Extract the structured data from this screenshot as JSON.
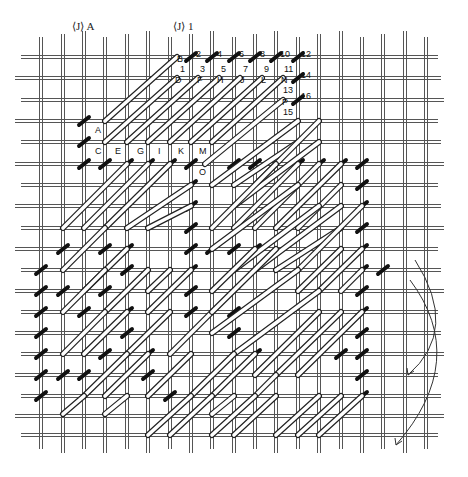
{
  "diagram": {
    "headers": [
      {
        "text": "⟨J⟩",
        "suffix": "A",
        "x": 72,
        "y": 30
      },
      {
        "text": "⟨J⟩",
        "suffix": "1",
        "x": 173,
        "y": 30
      }
    ],
    "grid": {
      "columns_x": [
        41,
        63,
        84,
        105,
        127,
        148,
        170,
        191,
        212,
        234,
        255,
        276,
        298,
        319,
        341,
        362,
        383,
        405,
        426
      ],
      "rows_y": [
        57,
        78,
        100,
        121,
        142,
        164,
        185,
        206,
        228,
        249,
        270,
        291,
        312,
        333,
        354,
        375,
        396,
        416,
        435
      ],
      "thread_color": "#555555",
      "style": "double-thread (Penelope) canvas"
    },
    "letter_labels": [
      {
        "text": "B",
        "x": 177,
        "y": 59
      },
      {
        "text": "D",
        "x": 175,
        "y": 80
      },
      {
        "text": "F",
        "x": 197,
        "y": 80
      },
      {
        "text": "H",
        "x": 217,
        "y": 80
      },
      {
        "text": "J",
        "x": 240,
        "y": 80
      },
      {
        "text": "L",
        "x": 261,
        "y": 80
      },
      {
        "text": "N",
        "x": 281,
        "y": 80
      },
      {
        "text": "P",
        "x": 282,
        "y": 102
      },
      {
        "text": "A",
        "x": 95,
        "y": 130
      },
      {
        "text": "C",
        "x": 95,
        "y": 151
      },
      {
        "text": "E",
        "x": 115,
        "y": 151
      },
      {
        "text": "G",
        "x": 137,
        "y": 151
      },
      {
        "text": "I",
        "x": 158,
        "y": 151
      },
      {
        "text": "K",
        "x": 178,
        "y": 151
      },
      {
        "text": "M",
        "x": 199,
        "y": 151
      },
      {
        "text": "O",
        "x": 199,
        "y": 172
      }
    ],
    "number_labels": [
      {
        "text": "1",
        "x": 180,
        "y": 69
      },
      {
        "text": "2",
        "x": 196,
        "y": 54
      },
      {
        "text": "3",
        "x": 200,
        "y": 69
      },
      {
        "text": "4",
        "x": 217,
        "y": 54
      },
      {
        "text": "5",
        "x": 221,
        "y": 69
      },
      {
        "text": "6",
        "x": 239,
        "y": 54
      },
      {
        "text": "7",
        "x": 243,
        "y": 69
      },
      {
        "text": "8",
        "x": 260,
        "y": 54
      },
      {
        "text": "9",
        "x": 264,
        "y": 69
      },
      {
        "text": "10",
        "x": 280,
        "y": 54
      },
      {
        "text": "11",
        "x": 284,
        "y": 69
      },
      {
        "text": "12",
        "x": 301,
        "y": 54
      },
      {
        "text": "13",
        "x": 283,
        "y": 90
      },
      {
        "text": "14",
        "x": 301,
        "y": 75
      },
      {
        "text": "15",
        "x": 283,
        "y": 112
      },
      {
        "text": "16",
        "x": 301,
        "y": 96
      }
    ],
    "tent_stitches": [
      [
        191,
        57
      ],
      [
        212,
        57
      ],
      [
        234,
        57
      ],
      [
        255,
        57
      ],
      [
        276,
        57
      ],
      [
        298,
        57
      ],
      [
        298,
        78
      ],
      [
        298,
        100
      ],
      [
        84,
        121
      ],
      [
        84,
        142
      ],
      [
        84,
        164
      ],
      [
        105,
        164
      ],
      [
        127,
        164
      ],
      [
        148,
        164
      ],
      [
        170,
        164
      ],
      [
        191,
        164
      ],
      [
        234,
        164
      ],
      [
        255,
        164
      ],
      [
        276,
        164
      ],
      [
        298,
        164
      ],
      [
        319,
        164
      ],
      [
        341,
        164
      ],
      [
        362,
        164
      ],
      [
        191,
        185
      ],
      [
        191,
        206
      ],
      [
        191,
        228
      ],
      [
        362,
        185
      ],
      [
        362,
        206
      ],
      [
        362,
        228
      ],
      [
        362,
        249
      ],
      [
        362,
        270
      ],
      [
        383,
        270
      ],
      [
        63,
        249
      ],
      [
        84,
        249
      ],
      [
        105,
        249
      ],
      [
        127,
        249
      ],
      [
        191,
        249
      ],
      [
        212,
        249
      ],
      [
        234,
        249
      ],
      [
        255,
        249
      ],
      [
        127,
        270
      ],
      [
        127,
        291
      ],
      [
        127,
        312
      ],
      [
        191,
        270
      ],
      [
        191,
        291
      ],
      [
        191,
        312
      ],
      [
        191,
        333
      ],
      [
        41,
        270
      ],
      [
        41,
        291
      ],
      [
        41,
        312
      ],
      [
        41,
        333
      ],
      [
        41,
        354
      ],
      [
        41,
        375
      ],
      [
        41,
        396
      ],
      [
        63,
        291
      ],
      [
        84,
        312
      ],
      [
        105,
        291
      ],
      [
        63,
        375
      ],
      [
        84,
        375
      ],
      [
        105,
        375
      ],
      [
        127,
        375
      ],
      [
        148,
        375
      ],
      [
        170,
        375
      ],
      [
        105,
        354
      ],
      [
        127,
        333
      ],
      [
        148,
        354
      ],
      [
        255,
        354
      ],
      [
        276,
        354
      ],
      [
        298,
        354
      ],
      [
        319,
        354
      ],
      [
        341,
        354
      ],
      [
        362,
        354
      ],
      [
        362,
        375
      ],
      [
        170,
        396
      ],
      [
        362,
        396
      ],
      [
        234,
        333
      ],
      [
        234,
        312
      ],
      [
        234,
        291
      ],
      [
        362,
        291
      ],
      [
        362,
        312
      ],
      [
        362,
        333
      ]
    ],
    "long_stitches": [
      [
        105,
        121,
        177,
        57
      ],
      [
        105,
        142,
        177,
        78
      ],
      [
        127,
        142,
        198,
        78
      ],
      [
        148,
        142,
        219,
        78
      ],
      [
        170,
        142,
        240,
        78
      ],
      [
        191,
        142,
        262,
        78
      ],
      [
        212,
        142,
        283,
        78
      ],
      [
        205,
        164,
        283,
        100
      ],
      [
        212,
        185,
        298,
        121
      ],
      [
        234,
        185,
        298,
        142
      ],
      [
        255,
        185,
        319,
        121
      ],
      [
        234,
        206,
        319,
        142
      ],
      [
        63,
        228,
        127,
        164
      ],
      [
        84,
        228,
        148,
        164
      ],
      [
        105,
        228,
        170,
        164
      ],
      [
        127,
        228,
        191,
        185
      ],
      [
        148,
        228,
        191,
        206
      ],
      [
        212,
        228,
        276,
        164
      ],
      [
        234,
        228,
        298,
        164
      ],
      [
        255,
        228,
        319,
        164
      ],
      [
        276,
        228,
        341,
        164
      ],
      [
        298,
        228,
        341,
        185
      ],
      [
        212,
        249,
        298,
        185
      ],
      [
        234,
        270,
        319,
        206
      ],
      [
        255,
        270,
        341,
        206
      ],
      [
        276,
        270,
        341,
        228
      ],
      [
        298,
        270,
        362,
        206
      ],
      [
        298,
        291,
        341,
        249
      ],
      [
        319,
        291,
        362,
        249
      ],
      [
        341,
        291,
        362,
        270
      ],
      [
        63,
        270,
        105,
        228
      ],
      [
        84,
        291,
        127,
        249
      ],
      [
        63,
        312,
        105,
        270
      ],
      [
        105,
        312,
        148,
        270
      ],
      [
        148,
        312,
        191,
        270
      ],
      [
        63,
        354,
        105,
        312
      ],
      [
        84,
        354,
        127,
        312
      ],
      [
        148,
        291,
        170,
        270
      ],
      [
        170,
        354,
        212,
        312
      ],
      [
        127,
        354,
        170,
        312
      ],
      [
        212,
        291,
        255,
        249
      ],
      [
        212,
        312,
        276,
        249
      ],
      [
        212,
        333,
        298,
        270
      ],
      [
        234,
        354,
        319,
        291
      ],
      [
        255,
        375,
        319,
        312
      ],
      [
        276,
        375,
        341,
        312
      ],
      [
        298,
        375,
        362,
        312
      ],
      [
        84,
        396,
        127,
        354
      ],
      [
        105,
        396,
        148,
        354
      ],
      [
        148,
        396,
        191,
        354
      ],
      [
        191,
        396,
        234,
        354
      ],
      [
        212,
        396,
        255,
        354
      ],
      [
        255,
        396,
        276,
        375
      ],
      [
        148,
        435,
        191,
        396
      ],
      [
        170,
        435,
        212,
        396
      ],
      [
        212,
        435,
        255,
        396
      ],
      [
        234,
        435,
        276,
        396
      ],
      [
        276,
        435,
        319,
        396
      ],
      [
        298,
        435,
        341,
        396
      ],
      [
        319,
        435,
        362,
        396
      ],
      [
        212,
        414,
        234,
        396
      ],
      [
        63,
        414,
        84,
        396
      ],
      [
        105,
        414,
        127,
        396
      ]
    ],
    "arrows": [
      {
        "path": "M 415 260 Q 460 330 408 375",
        "head_at": [
          408,
          375
        ]
      },
      {
        "path": "M 410 280 Q 470 360 396 445",
        "head_at": [
          396,
          445
        ]
      }
    ]
  }
}
